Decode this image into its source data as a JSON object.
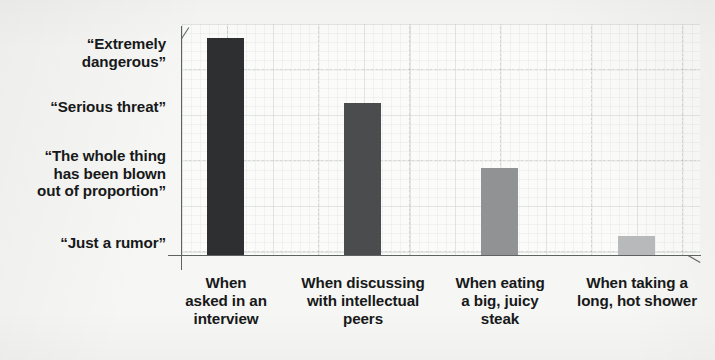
{
  "chart_data": {
    "type": "bar",
    "title": "",
    "subtitle": "",
    "xlabel": "",
    "ylabel": "",
    "orientation": "vertical",
    "grid": true,
    "grid_style": "graph-paper",
    "legend": false,
    "legend_position": "none",
    "categories": [
      "When\nasked in an\ninterview",
      "When discussing\nwith intellectual\npeers",
      "When eating\na big, juicy\nsteak",
      "When taking a\nlong, hot shower"
    ],
    "categories_flat": [
      "When asked in an interview",
      "When discussing with intellectual peers",
      "When eating a big, juicy steak",
      "When taking a long, hot shower"
    ],
    "y_tick_labels": [
      "“Extremely\ndangerous”",
      "“Serious threat”",
      "“The whole thing\nhas been blown\nout of proportion”",
      "“Just a rumor”"
    ],
    "y_tick_labels_flat": [
      "“Extremely dangerous”",
      "“Serious threat”",
      "“The whole thing has been blown out of proportion”",
      "“Just a rumor”"
    ],
    "y_tick_values": [
      4,
      3,
      2,
      1
    ],
    "ylim": [
      1,
      4.2
    ],
    "values": [
      4.0,
      3.05,
      2.1,
      1.25
    ],
    "bar_colors": [
      "#2e2f31",
      "#4b4c4e",
      "#919294",
      "#b9babb"
    ],
    "bar_labels": [
      "Extremely dangerous",
      "Serious threat",
      "The whole thing has been blown out of proportion",
      "Just a rumor"
    ]
  },
  "bars": [
    {
      "name": "bar-interview",
      "category": "When asked in an interview",
      "value_label": "“Extremely dangerous”",
      "color": "#2e2f31",
      "left_px": 207,
      "width_px": 37,
      "top_px": 38,
      "height_px": 218
    },
    {
      "name": "bar-intellectual-peers",
      "category": "When discussing with intellectual peers",
      "value_label": "“Serious threat”",
      "color": "#4b4c4e",
      "left_px": 344,
      "width_px": 37,
      "top_px": 103,
      "height_px": 153
    },
    {
      "name": "bar-steak",
      "category": "When eating a big, juicy steak",
      "value_label": "“The whole thing has been blown out of proportion”",
      "color": "#919294",
      "left_px": 481,
      "width_px": 37,
      "top_px": 168,
      "height_px": 88
    },
    {
      "name": "bar-shower",
      "category": "When taking a long, hot shower",
      "value_label": "“Just a rumor”",
      "color": "#b9babb",
      "left_px": 618,
      "width_px": 37,
      "top_px": 236,
      "height_px": 20
    }
  ],
  "y_label_positions": [
    {
      "text": "“Extremely\ndangerous”",
      "top_px": 35
    },
    {
      "text": "“Serious threat”",
      "top_px": 98
    },
    {
      "text": "“The whole thing\nhas been blown\nout of proportion”",
      "top_px": 147
    },
    {
      "text": "“Just a rumor”",
      "top_px": 234
    }
  ],
  "x_label_positions": [
    {
      "text": "When\nasked in an\ninterview",
      "center_px": 44
    },
    {
      "text": "When discussing\nwith intellectual\npeers",
      "center_px": 181
    },
    {
      "text": "When eating\na big, juicy\nsteak",
      "center_px": 318
    },
    {
      "text": "When taking a\nlong, hot shower",
      "center_px": 455
    }
  ],
  "style": {
    "background": "#f6f6f4",
    "plot_background": "#fbfbfa",
    "axis_color": "#5d6360",
    "grid_color": "#d6dad7",
    "text_color": "#17191a"
  }
}
